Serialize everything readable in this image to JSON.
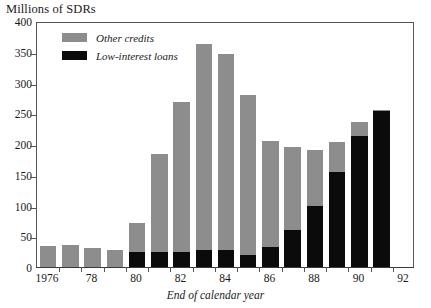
{
  "chart_data": {
    "type": "bar",
    "subtype": "stacked-vertical",
    "title": "",
    "ylabel": "Millions of SDRs",
    "xlabel": "End of calendar year",
    "ylim": [
      0,
      400
    ],
    "ytick_values": [
      0,
      50,
      100,
      150,
      200,
      250,
      300,
      350,
      400
    ],
    "ytick_labels": [
      "0",
      "50",
      "100",
      "150",
      "200",
      "250",
      "300",
      "350",
      "400"
    ],
    "grid": false,
    "legend_position": "upper-left-inside",
    "categories": [
      "1976",
      "1977",
      "1978",
      "1979",
      "1980",
      "1981",
      "1982",
      "1983",
      "1984",
      "1985",
      "1986",
      "1987",
      "1988",
      "1989",
      "1990",
      "1991",
      "1992"
    ],
    "xtick_labels": [
      "1976",
      "78",
      "80",
      "82",
      "84",
      "86",
      "88",
      "90",
      "92"
    ],
    "xtick_categories": [
      "1976",
      "1978",
      "1980",
      "1982",
      "1984",
      "1986",
      "1988",
      "1990",
      "1992"
    ],
    "series": [
      {
        "name": "Low-interest loans",
        "color": "#0b0b0b",
        "values": [
          0,
          0,
          0,
          0,
          25,
          25,
          25,
          27,
          27,
          20,
          33,
          60,
          99,
          155,
          213,
          253,
          0
        ]
      },
      {
        "name": "Other credits",
        "color": "#8d8d8d",
        "values": [
          34,
          35,
          31,
          28,
          47,
          158,
          243,
          336,
          319,
          260,
          172,
          135,
          92,
          48,
          23,
          2,
          0
        ]
      }
    ],
    "totals": [
      34,
      35,
      31,
      28,
      72,
      183,
      268,
      363,
      346,
      280,
      205,
      195,
      191,
      203,
      236,
      255,
      0
    ]
  },
  "legend": {
    "items": [
      {
        "label": "Other credits",
        "color": "#8d8d8d",
        "swatch_name": "legend-swatch-other-credits"
      },
      {
        "label": "Low-interest loans",
        "color": "#0b0b0b",
        "swatch_name": "legend-swatch-low-interest-loans"
      }
    ]
  }
}
